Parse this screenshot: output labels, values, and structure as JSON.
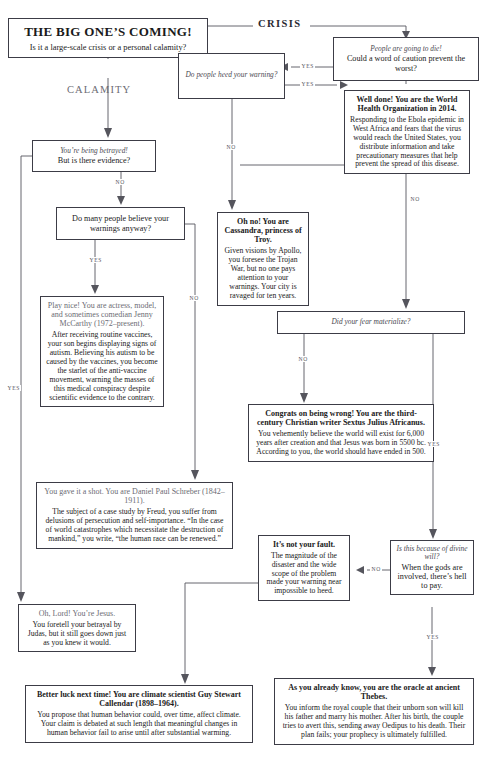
{
  "title": {
    "main": "THE BIG ONE’S COMING!",
    "sub": "Is it a large-scale crisis or a personal calamity?"
  },
  "branches": {
    "calamity": "CALAMITY",
    "crisis": "CRISIS"
  },
  "edge_labels": {
    "yes": "YES",
    "no": "NO"
  },
  "nodes": {
    "q_die": {
      "italic": "People are going to die!",
      "plain": "Could a word of caution prevent the worst?"
    },
    "q_heed": {
      "italic": "Do people heed your warning?"
    },
    "q_betray": {
      "italic": "You’re being betrayed!",
      "plain": "But is there evidence?"
    },
    "q_believe": {
      "plain": "Do many people believe your warnings anyway?"
    },
    "q_fear": {
      "italic": "Did your fear materialize?"
    },
    "q_divine": {
      "italic": "Is this because of divine will?",
      "plain": "When the gods are involved, there’s hell to pay."
    },
    "a_who": {
      "head": "Well done! You are the World Health Organization in 2014.",
      "body": "Responding to the Ebola epidemic in West Africa and fears that the virus would reach the United States, you distribute information and take precautionary measures that help prevent the spread of this disease."
    },
    "a_cassandra": {
      "head": "Oh no! You are Cassandra, princess of Troy.",
      "body": "Given visions by Apollo, you foresee the Trojan War, but no one pays attention to your warnings. Your city is ravaged for ten years."
    },
    "a_mccarthy": {
      "head": "Play nice! You are actress, model, and sometimes comedian Jenny McCarthy (1972–present).",
      "body": "After receiving routine vaccines, your son begins displaying signs of autism. Believing his autism to be caused by the vaccines, you become the starlet of the anti-vaccine movement, warning the masses of this medical conspiracy despite scientific evidence to the contrary."
    },
    "a_sextus": {
      "head": "Congrats on being wrong! You are the third-century Christian writer Sextus Julius Africanus.",
      "body": "You vehemently believe the world will exist for 6,000 years after creation and that Jesus was born in 5500 bc. According to you, the world should have ended in 500."
    },
    "a_schreber": {
      "head": "You gave it a shot. You are Daniel Paul Schreber (1842–1911).",
      "body": "The subject of a case study by Freud, you suffer from delusions of persecution and self-importance. “In the case of world catastrophes which necessitate the destruction of mankind,” you write, “the human race can be renewed.”"
    },
    "a_fault": {
      "head": "It’s not your fault.",
      "body": "The magnitude of the disaster and the wide scope of the problem made your warning near impossible to heed."
    },
    "a_jesus": {
      "head": "Oh, Lord! You’re Jesus.",
      "body": "You foretell your betrayal by Judas, but it still goes down just as you knew it would."
    },
    "a_callendar": {
      "head": "Better luck next time! You are climate scientist Guy Stewart Callendar (1898–1964).",
      "body": "You propose that human behavior could, over time, affect climate. Your claim is debated at such length that meaningful changes in human behavior fail to arise until after substantial warming."
    },
    "a_thebes": {
      "head": "As you already know, you are the oracle at ancient Thebes.",
      "body": "You inform the royal couple that their unborn son will kill his father and marry his mother. After his birth, the couple tries to avert this, sending away Oedipus to his death. Their plan fails; your prophecy is ultimately fulfilled."
    }
  },
  "colors": {
    "ink": "#1a1a1a",
    "rule": "#55555d",
    "muted": "#6c6c74"
  }
}
